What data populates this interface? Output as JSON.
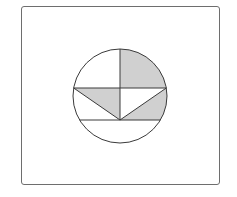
{
  "figure": {
    "colors": {
      "stroke": "#3a3a3a",
      "shade": "#d0d0d0",
      "background": "#ffffff",
      "frame": "#6e6e6e"
    },
    "circle": {
      "cx": 120,
      "cy": 96,
      "r": 47
    },
    "lines": [
      {
        "name": "vertical-radius",
        "x1": 120,
        "y1": 49,
        "x2": 120,
        "y2": 120
      },
      {
        "name": "upper-chord",
        "x1": 73.7,
        "y1": 88,
        "x2": 166.3,
        "y2": 88
      },
      {
        "name": "lower-chord",
        "x1": 79.6,
        "y1": 120,
        "x2": 160.4,
        "y2": 120
      },
      {
        "name": "left-diagonal",
        "x1": 73.7,
        "y1": 88,
        "x2": 120,
        "y2": 120
      },
      {
        "name": "right-diagonal",
        "x1": 166.3,
        "y1": 88,
        "x2": 120,
        "y2": 120
      }
    ],
    "shaded_regions": [
      "top-right-circular-sector",
      "left-triangle-below-upper-chord",
      "right-region-between-diagonal-and-arc"
    ]
  }
}
